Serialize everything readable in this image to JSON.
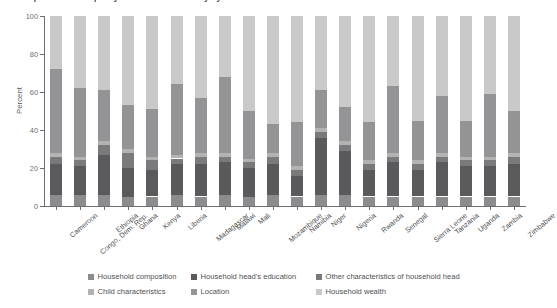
{
  "title": "Decomposition of inequality in under-five mortality by household characteristics",
  "axes": {
    "y_title": "Percent",
    "y_ticks": [
      0,
      20,
      40,
      60,
      80,
      100
    ],
    "y_min": 0,
    "y_max": 100
  },
  "legend": {
    "items": [
      {
        "label": "Household composition",
        "color": "#8c8c8e"
      },
      {
        "label": "Household head's education",
        "color": "#5a5a5c"
      },
      {
        "label": "Other characteristics of household head",
        "color": "#7a7a7c"
      },
      {
        "label": "Child characteristics",
        "color": "#b3b3b4"
      },
      {
        "label": "Location",
        "color": "#949496"
      },
      {
        "label": "Household wealth",
        "color": "#c9c9ca"
      }
    ]
  },
  "chart_data": {
    "type": "bar",
    "stacked": true,
    "stack_total": 100,
    "title": "Decomposition of inequality in under-five mortality by household characteristics",
    "xlabel": "",
    "ylabel": "Percent",
    "ylim": [
      0,
      100
    ],
    "grid": false,
    "legend_position": "bottom",
    "categories": [
      "Cameroon",
      "Congo, Dem. Rep.",
      "Ethiopia",
      "Ghana",
      "Kenya",
      "Liberia",
      "Madagascar",
      "Malawi",
      "Mali",
      "Mozambique",
      "Namibia",
      "Niger",
      "Nigeria",
      "Rwanda",
      "Senegal",
      "Sierra Leone",
      "Tanzania",
      "Uganda",
      "Zambia",
      "Zimbabwe"
    ],
    "series": [
      {
        "name": "Household composition",
        "color": "#8c8c8e",
        "values": [
          6,
          6,
          6,
          5,
          5,
          6,
          5,
          6,
          5,
          6,
          5,
          6,
          6,
          5,
          5,
          5,
          5,
          5,
          5,
          5
        ]
      },
      {
        "name": "Household head's education",
        "color": "#5a5a5c",
        "values": [
          16,
          15,
          21,
          15,
          14,
          16,
          17,
          17,
          15,
          16,
          11,
          30,
          23,
          14,
          18,
          14,
          18,
          16,
          16,
          17
        ]
      },
      {
        "name": "Other characteristics of household head",
        "color": "#7a7a7c",
        "values": [
          4,
          3,
          5,
          8,
          5,
          3,
          4,
          3,
          3,
          4,
          3,
          3,
          3,
          3,
          3,
          3,
          3,
          3,
          3,
          4
        ]
      },
      {
        "name": "Child characteristics",
        "color": "#b3b3b4",
        "values": [
          2,
          2,
          2,
          2,
          2,
          2,
          2,
          2,
          2,
          2,
          2,
          2,
          2,
          2,
          2,
          2,
          2,
          2,
          2,
          2
        ]
      },
      {
        "name": "Location",
        "color": "#949496",
        "values": [
          44,
          36,
          27,
          23,
          25,
          37,
          29,
          40,
          25,
          15,
          23,
          20,
          18,
          20,
          35,
          21,
          30,
          19,
          33,
          22
        ]
      },
      {
        "name": "Household wealth",
        "color": "#c9c9ca",
        "values": [
          28,
          38,
          39,
          47,
          49,
          36,
          43,
          32,
          50,
          57,
          56,
          39,
          48,
          56,
          37,
          55,
          42,
          55,
          41,
          50
        ]
      }
    ]
  }
}
